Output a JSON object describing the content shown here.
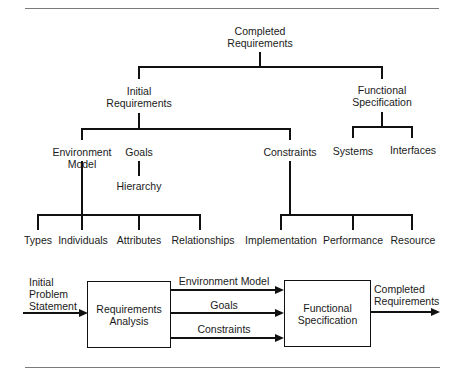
{
  "tree": {
    "root": {
      "lines": [
        "Completed",
        "Requirements"
      ]
    },
    "level1": [
      {
        "id": "initial",
        "lines": [
          "Initial",
          "Requirements"
        ]
      },
      {
        "id": "functional",
        "lines": [
          "Functional",
          "Specification"
        ]
      }
    ],
    "initial_children": [
      {
        "id": "environment",
        "lines": [
          "Environment",
          "Model"
        ]
      },
      {
        "id": "goals",
        "lines": [
          "Goals"
        ]
      },
      {
        "id": "constraints",
        "lines": [
          "Constraints"
        ]
      }
    ],
    "functional_children": [
      {
        "id": "systems",
        "label": "Systems"
      },
      {
        "id": "interfaces",
        "label": "Interfaces"
      }
    ],
    "goals_children": [
      {
        "id": "hierarchy",
        "label": "Hierarchy"
      }
    ],
    "environment_children": [
      {
        "id": "types",
        "label": "Types"
      },
      {
        "id": "individuals",
        "label": "Individuals"
      },
      {
        "id": "attributes",
        "label": "Attributes"
      },
      {
        "id": "relationships",
        "label": "Relationships"
      }
    ],
    "constraints_children": [
      {
        "id": "implementation",
        "label": "Implementation"
      },
      {
        "id": "performance",
        "label": "Performance"
      },
      {
        "id": "resource",
        "label": "Resource"
      }
    ]
  },
  "flow": {
    "input": {
      "lines": [
        "Initial",
        "Problem",
        "Statement"
      ]
    },
    "box1": {
      "lines": [
        "Requirements",
        "Analysis"
      ]
    },
    "box2": {
      "lines": [
        "Functional",
        "Specification"
      ]
    },
    "connectors": [
      {
        "label": "Environment Model"
      },
      {
        "label": "Goals"
      },
      {
        "label": "Constraints"
      }
    ],
    "output": {
      "lines": [
        "Completed",
        "Requirements"
      ]
    }
  }
}
